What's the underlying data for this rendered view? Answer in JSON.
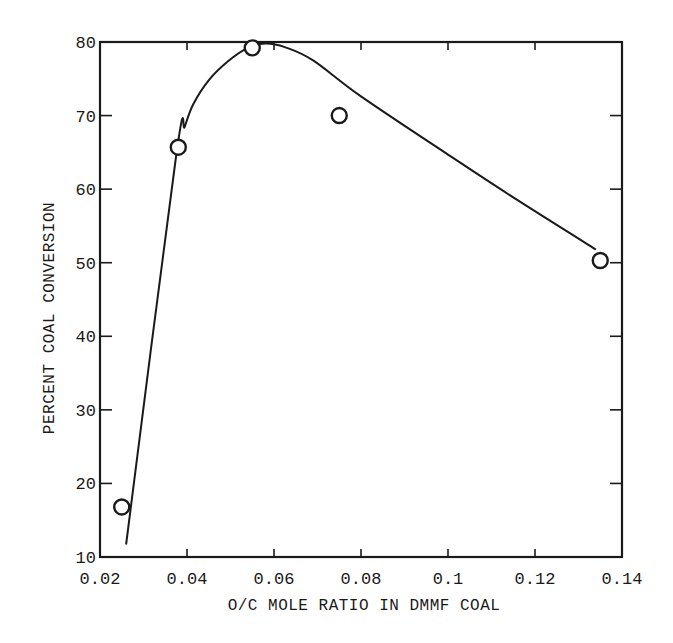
{
  "chart_data": {
    "type": "line",
    "title": "",
    "xlabel": "O/C MOLE RATIO IN DMMF COAL",
    "ylabel": "PERCENT COAL CONVERSION",
    "xlim": [
      0.02,
      0.14
    ],
    "ylim": [
      10,
      80
    ],
    "grid": false,
    "legend": null,
    "x_ticks": [
      0.02,
      0.04,
      0.06,
      0.08,
      0.1,
      0.12,
      0.14
    ],
    "x_tick_labels": [
      "0.02",
      "0.04",
      "0.06",
      "0.08",
      "0.1",
      "0.12",
      "0.14"
    ],
    "y_ticks": [
      10,
      20,
      30,
      40,
      50,
      60,
      70,
      80
    ],
    "y_tick_labels": [
      "10",
      "20",
      "30",
      "40",
      "50",
      "60",
      "70",
      "80"
    ],
    "series": [
      {
        "name": "Measured data",
        "kind": "scatter",
        "marker": "open-circle",
        "points": [
          {
            "x": 0.025,
            "y": 16.8
          },
          {
            "x": 0.038,
            "y": 65.7
          },
          {
            "x": 0.055,
            "y": 79.2
          },
          {
            "x": 0.075,
            "y": 70.0
          },
          {
            "x": 0.135,
            "y": 50.3
          }
        ]
      },
      {
        "name": "Fitted curve",
        "kind": "line",
        "points": [
          {
            "x": 0.026,
            "y": 11.7
          },
          {
            "x": 0.0375,
            "y": 64.5
          },
          {
            "x": 0.0395,
            "y": 68.5
          },
          {
            "x": 0.0415,
            "y": 71.6
          },
          {
            "x": 0.045,
            "y": 74.8
          },
          {
            "x": 0.0495,
            "y": 77.4
          },
          {
            "x": 0.054,
            "y": 79.2
          },
          {
            "x": 0.058,
            "y": 79.8
          },
          {
            "x": 0.0625,
            "y": 79.3
          },
          {
            "x": 0.069,
            "y": 77.5
          },
          {
            "x": 0.08,
            "y": 72.6
          },
          {
            "x": 0.1,
            "y": 64.7
          },
          {
            "x": 0.116,
            "y": 58.5
          },
          {
            "x": 0.134,
            "y": 51.8
          }
        ]
      }
    ]
  },
  "style": {
    "ink": "#1a1a1a",
    "background": "#ffffff"
  }
}
